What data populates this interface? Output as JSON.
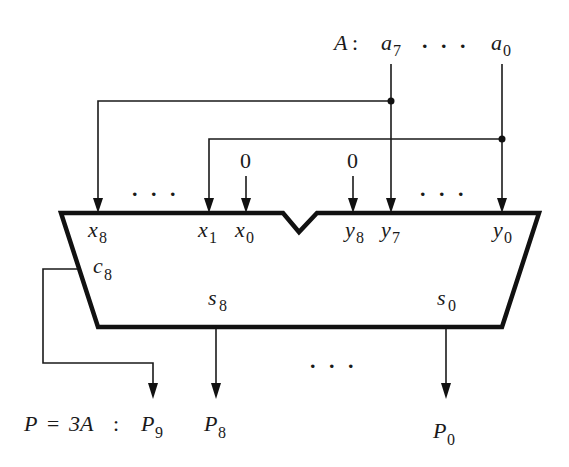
{
  "diagram": {
    "input": {
      "label": "A",
      "separator": ":",
      "bits": [
        {
          "letter": "a",
          "sub": "7"
        },
        {
          "letter": "a",
          "sub": "0"
        }
      ],
      "ellipsis": ". . ."
    },
    "adder": {
      "x_inputs": [
        {
          "letter": "x",
          "sub": "8"
        },
        {
          "letter": "x",
          "sub": "1"
        },
        {
          "letter": "x",
          "sub": "0"
        }
      ],
      "y_inputs": [
        {
          "letter": "y",
          "sub": "8"
        },
        {
          "letter": "y",
          "sub": "7"
        },
        {
          "letter": "y",
          "sub": "0"
        }
      ],
      "constant_inputs": [
        "0",
        "0"
      ],
      "carry_out": {
        "letter": "c",
        "sub": "8"
      },
      "sum_outputs": [
        {
          "letter": "s",
          "sub": "8"
        },
        {
          "letter": "s",
          "sub": "0"
        }
      ],
      "x_ellipsis": ". . .",
      "y_ellipsis": ". . .",
      "out_ellipsis": ". . ."
    },
    "output": {
      "label": "P = 3A",
      "separator": ":",
      "bits": [
        {
          "letter": "P",
          "sub": "9"
        },
        {
          "letter": "P",
          "sub": "8"
        },
        {
          "letter": "P",
          "sub": "0"
        }
      ]
    },
    "colors": {
      "line": "#111111",
      "background": "#ffffff"
    }
  }
}
